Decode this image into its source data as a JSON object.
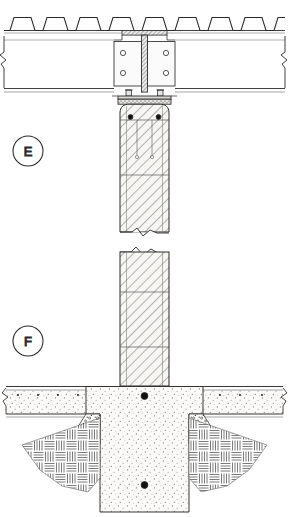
{
  "sheet": {
    "title": "Structural Connection Details",
    "background_color": "#ffffff",
    "line_color": "#2a2a2a",
    "hatch_color": "#555555",
    "concrete_fill": "#f4f3f0",
    "steel_fill": "#efefef"
  },
  "detail_markers": [
    {
      "id": "detail-marker-e",
      "label": "E",
      "cx": 28,
      "cy": 151,
      "r": 15,
      "description": "Detail bubble E - steel beam to concrete column connection"
    },
    {
      "id": "detail-marker-f",
      "label": "F",
      "cx": 28,
      "cy": 341,
      "r": 15,
      "description": "Detail bubble F - concrete column to spread footing on grade"
    }
  ],
  "detail_e": {
    "name": "Steel beam to concrete column head connection",
    "components": [
      {
        "name": "metal-deck",
        "label": "Corrugated metal deck",
        "ribs": 9,
        "top_y": 10,
        "bottom_y": 31,
        "rib_height": 13
      },
      {
        "name": "steel-beam",
        "label": "Steel beam web and flanges",
        "web_top_y": 34,
        "web_bottom_y": 95,
        "web_width": 6
      },
      {
        "name": "splice-plates",
        "label": "Bolted splice plates",
        "plate_count": 2,
        "bolts_per_plate": 2,
        "bolt_total": 4,
        "plate_top_y": 41,
        "plate_bottom_y": 86
      },
      {
        "name": "base-plate",
        "label": "Steel base plate with grout bed",
        "y": 95,
        "anchor_bolts": 2
      },
      {
        "name": "concrete-column-upper",
        "label": "Reinforced concrete column (hatched)",
        "top_y": 105,
        "bottom_y": 232,
        "rebar_dots": 2,
        "ties": 2
      },
      {
        "name": "break-line-left",
        "label": "Break line at left edge"
      },
      {
        "name": "break-line-right",
        "label": "Break line at right edge"
      }
    ]
  },
  "detail_f": {
    "name": "Concrete column to spread footing and slab on grade",
    "components": [
      {
        "name": "concrete-column-lower",
        "label": "Reinforced concrete column continuation (hatched)",
        "top_y": 248,
        "bottom_y": 385,
        "ties": 2
      },
      {
        "name": "slab-on-grade",
        "label": "Concrete slab on grade with stipple fill",
        "top_y": 386,
        "bottom_y": 414,
        "rebar_dot_row": true
      },
      {
        "name": "spread-footing",
        "label": "Concrete spread footing pier (stipple fill)",
        "top_y": 386,
        "bottom_y": 512,
        "rebar_dots": 2
      },
      {
        "name": "granular-backfill-left",
        "label": "Granular / gravel backfill at sloped excavation - left"
      },
      {
        "name": "granular-backfill-right",
        "label": "Granular / gravel backfill at sloped excavation - right"
      },
      {
        "name": "undisturbed-soil-left",
        "label": "Undisturbed earth hatch - left"
      },
      {
        "name": "undisturbed-soil-right",
        "label": "Undisturbed earth hatch - right"
      }
    ]
  }
}
